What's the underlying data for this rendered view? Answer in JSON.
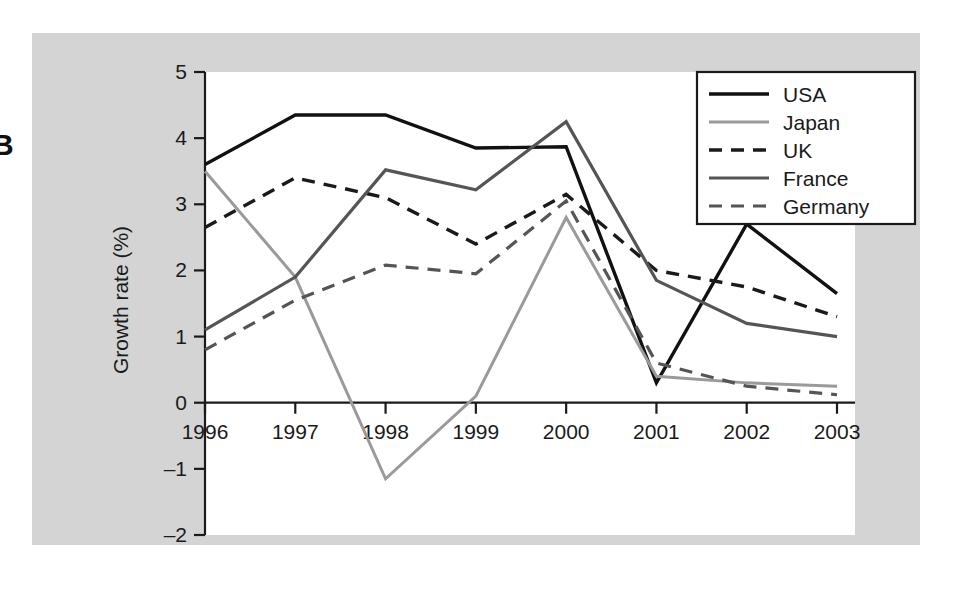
{
  "figure": {
    "panel_letter": "B",
    "background_color": "#ffffff",
    "matte_color": "#d4d4d4",
    "plot_background_color": "#ffffff"
  },
  "chart_data": {
    "type": "line",
    "title": "",
    "xlabel": "",
    "ylabel": "Growth rate (%)",
    "categories": [
      "1996",
      "1997",
      "1998",
      "1999",
      "2000",
      "2001",
      "2002",
      "2003"
    ],
    "x": [
      1996,
      1997,
      1998,
      1999,
      2000,
      2001,
      2002,
      2003
    ],
    "xlim": [
      1996,
      2003
    ],
    "ylim": [
      -2,
      5
    ],
    "yticks": [
      -2,
      -1,
      0,
      1,
      2,
      3,
      4,
      5
    ],
    "ytick_labels": [
      "-2",
      "-1",
      "0",
      "1",
      "2",
      "3",
      "4",
      "5"
    ],
    "grid": false,
    "legend_position": "top-right",
    "series": [
      {
        "name": "USA",
        "values": [
          3.6,
          4.35,
          4.35,
          3.85,
          3.87,
          0.3,
          2.7,
          1.65
        ],
        "color": "#111111",
        "style": "solid",
        "width": 3.4
      },
      {
        "name": "Japan",
        "values": [
          3.5,
          1.9,
          -1.15,
          0.1,
          2.8,
          0.4,
          0.3,
          0.25
        ],
        "color": "#9a9a9a",
        "style": "solid",
        "width": 3.0
      },
      {
        "name": "UK",
        "values": [
          2.65,
          3.4,
          3.1,
          2.4,
          3.15,
          2.0,
          1.75,
          1.3
        ],
        "color": "#1a1a1a",
        "style": "dashed",
        "width": 3.4
      },
      {
        "name": "France",
        "values": [
          1.1,
          1.9,
          3.52,
          3.22,
          4.25,
          1.85,
          1.2,
          1.0
        ],
        "color": "#555555",
        "style": "solid",
        "width": 3.2
      },
      {
        "name": "Germany",
        "values": [
          0.8,
          1.55,
          2.08,
          1.95,
          3.05,
          0.6,
          0.25,
          0.12
        ],
        "color": "#555555",
        "style": "dashed",
        "width": 3.2
      }
    ]
  },
  "legend": {
    "entries": [
      "USA",
      "Japan",
      "UK",
      "France",
      "Germany"
    ]
  }
}
